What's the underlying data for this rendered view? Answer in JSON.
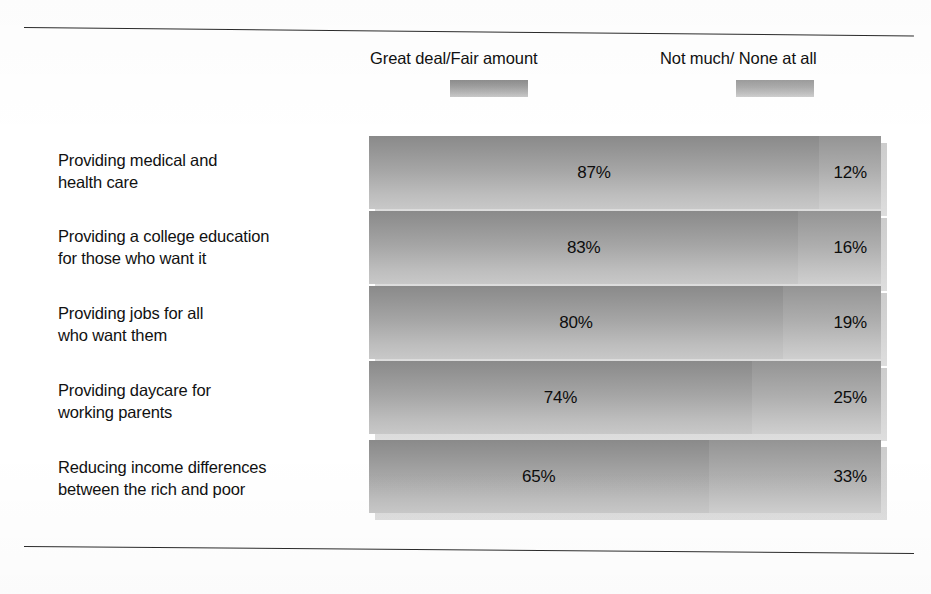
{
  "legend": {
    "items": [
      {
        "label": "Great deal/Fair amount",
        "swatch": "gradient-gray-dark"
      },
      {
        "label": "Not much/ None at all",
        "swatch": "gradient-gray-light"
      }
    ]
  },
  "chart_data": {
    "type": "bar",
    "orientation": "horizontal",
    "stacked": true,
    "title": "",
    "subtitle": "",
    "xlabel": "",
    "ylabel": "",
    "xlim": [
      0,
      100
    ],
    "grid": false,
    "legend_position": "top",
    "categories": [
      "Providing medical and health care",
      "Providing a college education for those who want it",
      "Providing jobs for all who want them",
      "Providing daycare for working parents",
      "Reducing income differences between the rich and poor"
    ],
    "category_lines": [
      [
        "Providing medical and",
        "health care"
      ],
      [
        "Providing a college education",
        "for those who want it"
      ],
      [
        "Providing jobs for all",
        "who want them"
      ],
      [
        "Providing daycare for",
        "working parents"
      ],
      [
        "Reducing income differences",
        "between the rich and poor"
      ]
    ],
    "series": [
      {
        "name": "Great deal/Fair amount",
        "values": [
          87,
          83,
          80,
          74,
          65
        ],
        "labels": [
          "87%",
          "83%",
          "80%",
          "74%",
          "65%"
        ]
      },
      {
        "name": "Not much/ None at all",
        "values": [
          12,
          16,
          19,
          25,
          33
        ],
        "labels": [
          "12%",
          "16%",
          "19%",
          "25%",
          "33%"
        ]
      }
    ]
  },
  "colors": {
    "series_a_dark": "#8a8a8a",
    "series_a_light": "#c8c8c8",
    "series_b_dark": "#949494",
    "series_b_light": "#cfcfcf",
    "shadow": "#d6d6d6",
    "rule": "#2b2b2b",
    "text": "#111111",
    "background": "#ffffff"
  }
}
